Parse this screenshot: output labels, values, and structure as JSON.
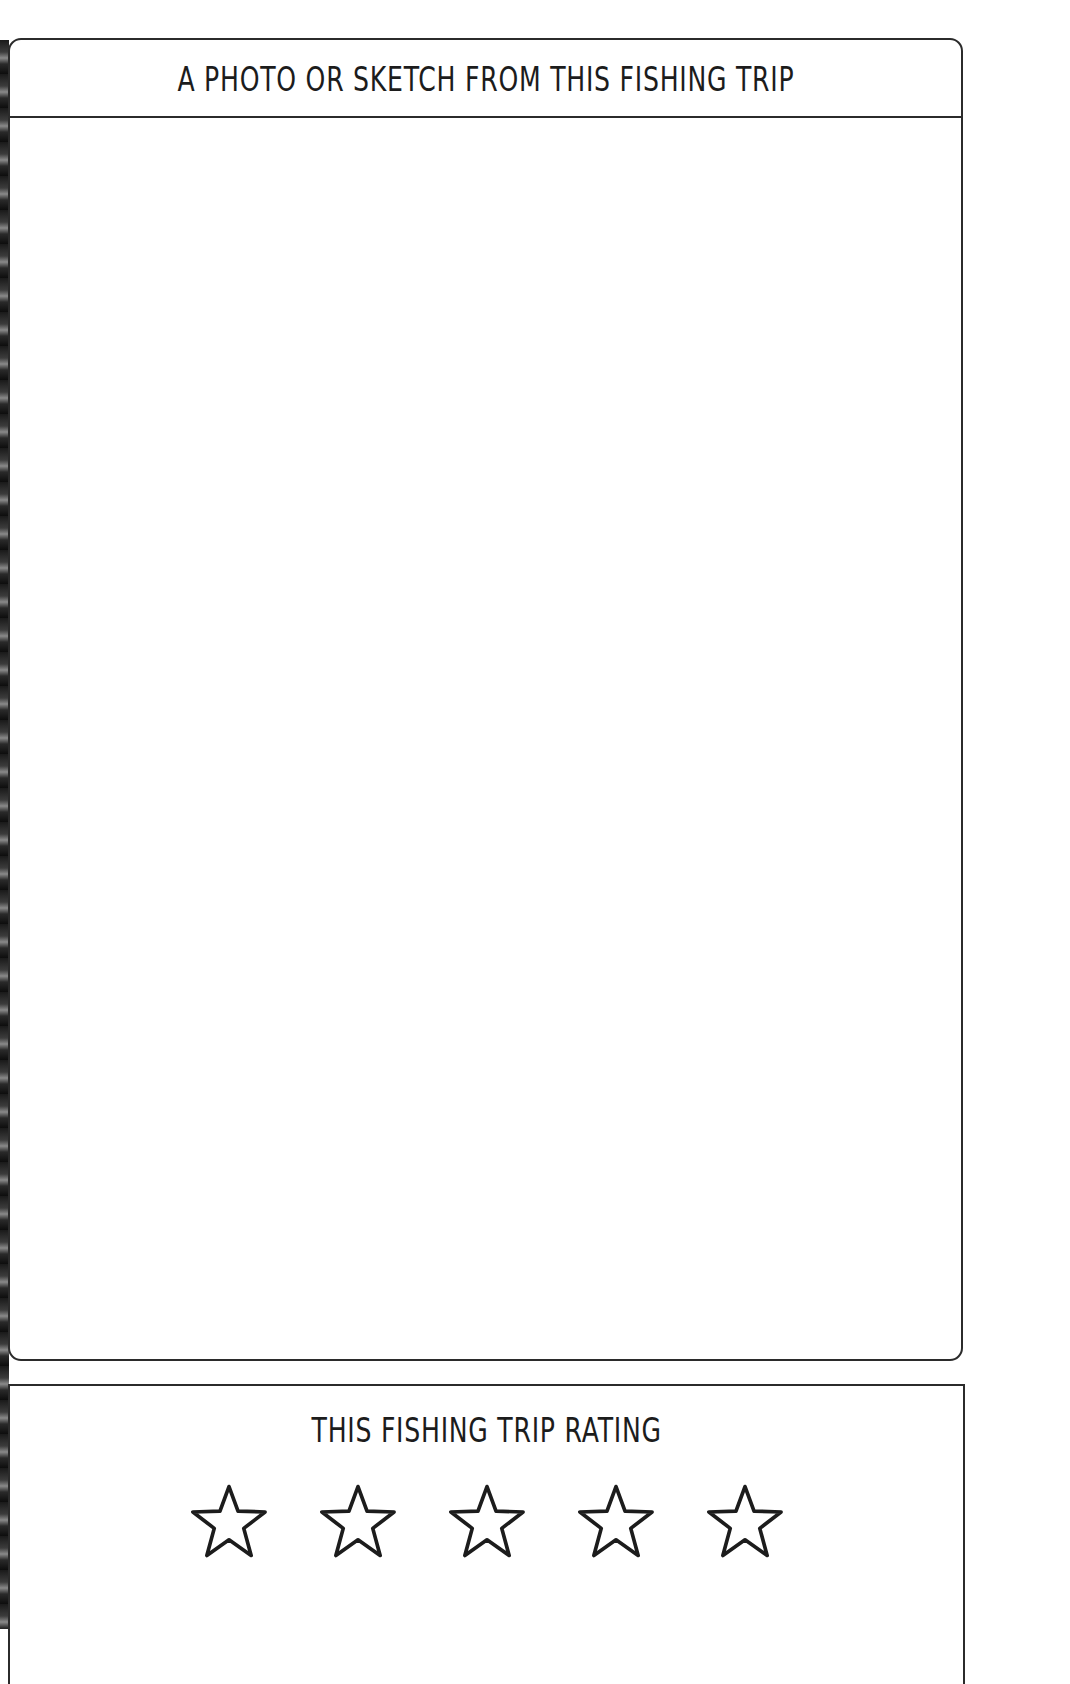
{
  "photo_section": {
    "title": "A PHOTO OR SKETCH FROM THIS FISHING TRIP"
  },
  "rating_section": {
    "title": "THIS FISHING TRIP RATING",
    "max_stars": 5,
    "filled_stars": 0,
    "star_icon": "star-outline-icon",
    "stars": [
      {
        "index": 1,
        "state": "empty"
      },
      {
        "index": 2,
        "state": "empty"
      },
      {
        "index": 3,
        "state": "empty"
      },
      {
        "index": 4,
        "state": "empty"
      },
      {
        "index": 5,
        "state": "empty"
      }
    ]
  },
  "colors": {
    "ink": "#1c1c1c",
    "border": "#2b2b2b",
    "paper": "#ffffff"
  }
}
